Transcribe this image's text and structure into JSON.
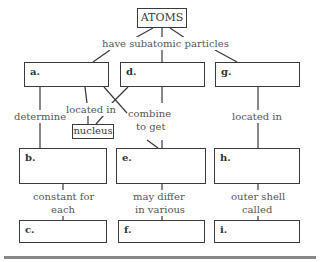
{
  "title": "ATOMS",
  "top_link": "have subatomic particles",
  "boxes": {
    "a": "a.",
    "b": "b.",
    "c": "c.",
    "d": "d.",
    "e": "e.",
    "f": "f.",
    "g": "g.",
    "h": "h.",
    "i": "i."
  },
  "nucleus": "nucleus",
  "links": {
    "determine": "determine",
    "located_in_left": "located in",
    "combine_1": "combine",
    "combine_2": "to get",
    "located_in_right": "located in",
    "constant_1": "constant for",
    "constant_2": "each",
    "differ_1": "may differ",
    "differ_2": "in various",
    "outer_1": "outer shell",
    "outer_2": "called"
  }
}
